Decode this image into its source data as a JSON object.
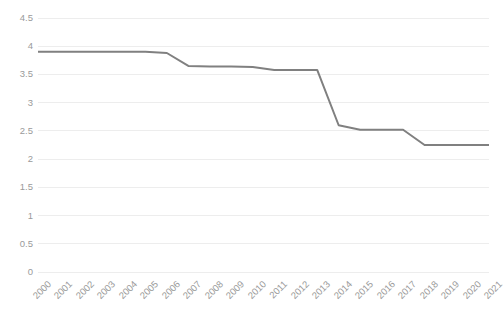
{
  "chart_data": {
    "type": "line",
    "title": "",
    "subtitle": "",
    "xlabel": "",
    "ylabel": "",
    "categories": [
      "2000",
      "2001",
      "2002",
      "2003",
      "2004",
      "2005",
      "2006",
      "2007",
      "2008",
      "2009",
      "2010",
      "2011",
      "2012",
      "2013",
      "2014",
      "2015",
      "2016",
      "2017",
      "2018",
      "2019",
      "2020",
      "2021"
    ],
    "values": [
      3.9,
      3.9,
      3.9,
      3.9,
      3.9,
      3.9,
      3.88,
      3.65,
      3.64,
      3.64,
      3.63,
      3.58,
      3.58,
      3.58,
      2.6,
      2.52,
      2.52,
      2.52,
      2.25,
      2.25,
      2.25,
      2.25
    ],
    "series": [
      {
        "name": "series-1",
        "color": "#808080",
        "values": [
          3.9,
          3.9,
          3.9,
          3.9,
          3.9,
          3.9,
          3.88,
          3.65,
          3.64,
          3.64,
          3.63,
          3.58,
          3.58,
          3.58,
          2.6,
          2.52,
          2.52,
          2.52,
          2.25,
          2.25,
          2.25,
          2.25
        ]
      }
    ],
    "ylim": [
      0,
      4.5
    ],
    "yticks": [
      0,
      0.5,
      1,
      1.5,
      2,
      2.5,
      3,
      3.5,
      4,
      4.5
    ],
    "ytick_labels": [
      "0",
      "0.5",
      "1",
      "1.5",
      "2",
      "2.5",
      "3",
      "3.5",
      "4",
      "4.5"
    ],
    "xtick_labels": [
      "2000",
      "2001",
      "2002",
      "2003",
      "2004",
      "2005",
      "2006",
      "2007",
      "2008",
      "2009",
      "2010",
      "2011",
      "2012",
      "2013",
      "2014",
      "2015",
      "2016",
      "2017",
      "2018",
      "2019",
      "2020",
      "2021"
    ],
    "grid": true,
    "grid_axis": "y",
    "grid_color": "#ededed",
    "legend": false,
    "legend_position": "none",
    "line_color": "#808080",
    "line_width": 2,
    "markers": false,
    "background_color": "#ffffff",
    "tick_label_color": "#9a9a9a",
    "xtick_rotation": -45
  }
}
